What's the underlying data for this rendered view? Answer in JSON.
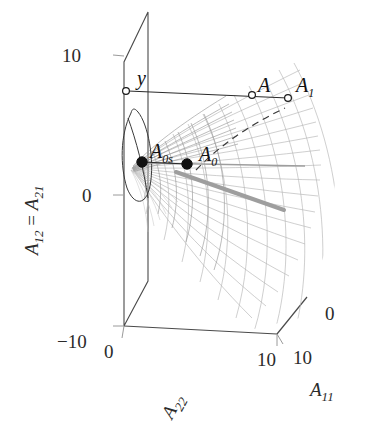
{
  "figure": {
    "type": "3d-surface-plot",
    "background_color": "#ffffff",
    "mesh_color": "#b9b9b9",
    "mesh_shade_color": "#9a9a9a",
    "axis_color": "#555555",
    "marker_color": "#111111",
    "ray_color": "#9e9e9e"
  },
  "axes": {
    "vertical": {
      "name": "A12 = A21",
      "label_main": "A",
      "label_sub_a": "12",
      "label_eq": " = ",
      "label_b": "A",
      "label_sub_b": "21",
      "ticks": [
        "10",
        "0",
        "-10"
      ],
      "tick_top": "10",
      "tick_mid": "0",
      "tick_bottom": "−10",
      "range": [
        -10,
        10
      ]
    },
    "depth": {
      "name": "A22",
      "label_main": "A",
      "label_sub": "22",
      "tick_near": "0",
      "tick_far": "10",
      "ticks": [
        "0",
        "10"
      ],
      "range": [
        0,
        10
      ]
    },
    "horizontal": {
      "name": "A11",
      "label_main": "A",
      "label_sub": "11",
      "tick_near": "10",
      "tick_far": "0",
      "ticks": [
        "10",
        "0"
      ],
      "range": [
        0,
        10
      ]
    }
  },
  "markers": [
    {
      "id": "y",
      "label": "y",
      "sub": "",
      "style": "open-circle",
      "x": 126,
      "y": 91,
      "label_x": 137,
      "label_y": 84
    },
    {
      "id": "A",
      "label": "A",
      "sub": "",
      "style": "open-circle",
      "x": 252,
      "y": 94,
      "label_x": 258,
      "label_y": 90
    },
    {
      "id": "A1",
      "label": "A",
      "sub": "1",
      "style": "open-circle",
      "x": 288,
      "y": 97,
      "label_x": 295,
      "label_y": 91
    },
    {
      "id": "A0s",
      "label": "A",
      "sub": "0s",
      "style": "filled-circle",
      "x": 142,
      "y": 162,
      "label_x": 150,
      "label_y": 155
    },
    {
      "id": "A0",
      "label": "A",
      "sub": "0",
      "style": "filled-circle",
      "x": 187,
      "y": 164,
      "label_x": 198,
      "label_y": 158
    }
  ],
  "annotations": {
    "dashed_curve": "geodesic-path",
    "thick_ray": "ray-from-A0",
    "ellipse_curve": "section-ellipse"
  }
}
